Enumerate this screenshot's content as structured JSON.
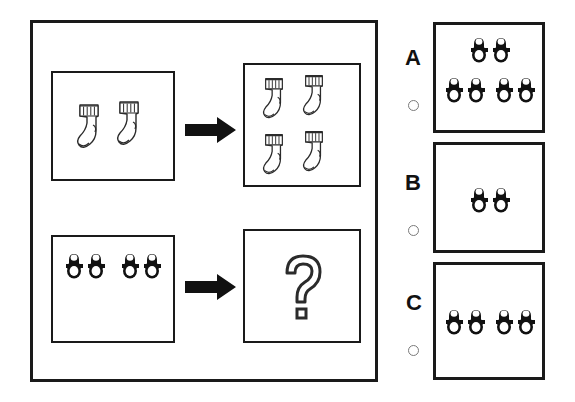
{
  "puzzle": {
    "type": "visual-analogy-multiple-choice",
    "title_text": "",
    "main_frame": {
      "rows": [
        {
          "name": "example-row",
          "left_cell": {
            "item": "sock",
            "count": 2,
            "description": "two socks"
          },
          "operator": "arrow-right",
          "right_cell": {
            "item": "sock",
            "count": 4,
            "description": "four socks"
          }
        },
        {
          "name": "question-row",
          "left_cell": {
            "item": "shoe-pair",
            "count": 2,
            "description": "two pairs of shoes"
          },
          "operator": "arrow-right",
          "right_cell": {
            "item": "question-mark",
            "count": 1,
            "symbol": "?",
            "description": "unknown answer"
          }
        }
      ]
    },
    "options": [
      {
        "letter": "A",
        "item": "shoe-pair",
        "count": 3,
        "selected": false,
        "description": "three pairs of shoes"
      },
      {
        "letter": "B",
        "item": "shoe-pair",
        "count": 1,
        "selected": false,
        "description": "one pair of shoes"
      },
      {
        "letter": "C",
        "item": "shoe-pair",
        "count": 2,
        "selected": false,
        "description": "two pairs of shoes"
      }
    ],
    "colors": {
      "frame_stroke": "#1a1a1a",
      "box_stroke": "#1a1a1a",
      "arrow_fill": "#111111",
      "shoe_fill": "#111111",
      "sock_stroke": "#2b2b2b",
      "radio_stroke": "#7a7a7a",
      "background": "#ffffff"
    },
    "icons": {
      "sock": "sock-icon",
      "shoe": "mary-jane-shoe-icon",
      "arrow": "arrow-right-icon",
      "question": "question-mark-icon",
      "radio": "radio-button-icon"
    }
  }
}
